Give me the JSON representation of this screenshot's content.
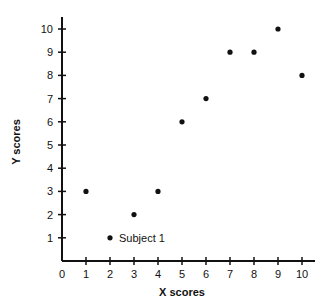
{
  "chart_data": {
    "type": "scatter",
    "title": "",
    "xlabel": "X scores",
    "ylabel": "Y scores",
    "xlim": [
      0,
      10
    ],
    "ylim": [
      0,
      10
    ],
    "x_ticks": [
      0,
      1,
      2,
      3,
      4,
      5,
      6,
      7,
      8,
      9,
      10
    ],
    "y_ticks": [
      1,
      2,
      3,
      4,
      5,
      6,
      7,
      8,
      9,
      10
    ],
    "grid": false,
    "legend": null,
    "points": [
      {
        "x": 1,
        "y": 3
      },
      {
        "x": 2,
        "y": 1,
        "label": "Subject 1"
      },
      {
        "x": 3,
        "y": 2
      },
      {
        "x": 4,
        "y": 3
      },
      {
        "x": 5,
        "y": 6
      },
      {
        "x": 6,
        "y": 7
      },
      {
        "x": 7,
        "y": 9
      },
      {
        "x": 8,
        "y": 9
      },
      {
        "x": 9,
        "y": 10
      },
      {
        "x": 10,
        "y": 8
      }
    ],
    "annotations": [
      {
        "text": "Subject 1",
        "x": 2,
        "y": 1
      }
    ],
    "marker_color": "#111111"
  }
}
